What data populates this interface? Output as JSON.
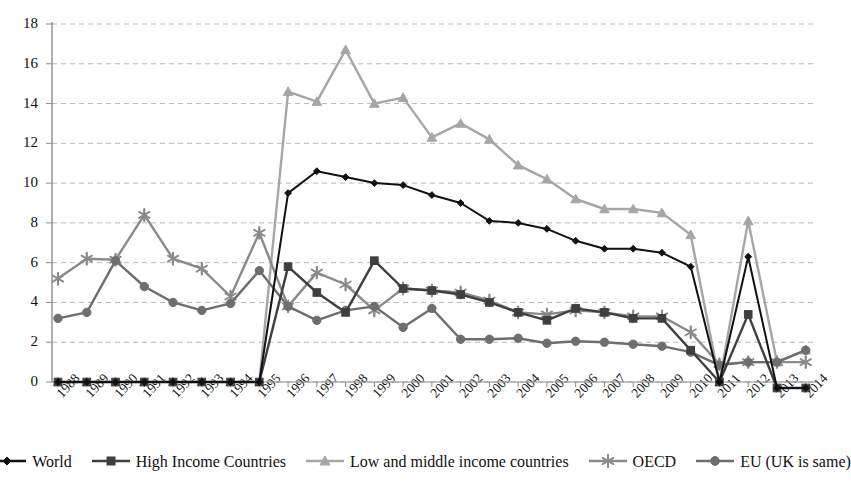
{
  "chart_data": {
    "type": "line",
    "title": "",
    "xlabel": "",
    "ylabel": "",
    "ylim": [
      0,
      18
    ],
    "ytick_step": 2,
    "grid": true,
    "legend_position": "bottom",
    "categories": [
      "1988",
      "1989",
      "1990",
      "1991",
      "1992",
      "1993",
      "1994",
      "1995",
      "1996",
      "1997",
      "1998",
      "1999",
      "2000",
      "2001",
      "2002",
      "2003",
      "2004",
      "2005",
      "2006",
      "2007",
      "2008",
      "2009",
      "2010",
      "2011",
      "2012",
      "2013",
      "2014"
    ],
    "yticks": [
      "0",
      "2",
      "4",
      "6",
      "8",
      "10",
      "12",
      "14",
      "16",
      "18"
    ],
    "series": [
      {
        "name": "World",
        "marker": "diamond",
        "color": "#111111",
        "values": [
          0,
          0,
          0,
          0,
          0,
          0,
          0,
          0,
          9.5,
          10.6,
          10.3,
          10.0,
          9.9,
          9.4,
          9.0,
          8.1,
          8.0,
          7.7,
          7.1,
          6.7,
          6.7,
          6.5,
          5.8,
          0.0,
          6.3,
          -0.3,
          -0.3
        ]
      },
      {
        "name": "High Income Countries",
        "marker": "square",
        "color": "#3f3f3f",
        "values": [
          0,
          0,
          0,
          0,
          0,
          0,
          0,
          0,
          5.8,
          4.5,
          3.5,
          6.1,
          4.7,
          4.6,
          4.4,
          4.0,
          3.5,
          3.1,
          3.7,
          3.5,
          3.2,
          3.2,
          1.6,
          0.0,
          3.4,
          -0.3,
          -0.3
        ]
      },
      {
        "name": "Low and middle income countries",
        "marker": "triangle",
        "color": "#a6a6a6",
        "values": [
          0,
          0,
          0,
          0,
          0,
          0,
          0,
          0,
          14.6,
          14.1,
          16.7,
          14.0,
          14.3,
          12.3,
          13.0,
          12.2,
          10.9,
          10.2,
          9.2,
          8.7,
          8.7,
          8.5,
          7.4,
          0.0,
          8.1,
          1.0,
          1.6
        ]
      },
      {
        "name": "OECD",
        "marker": "star",
        "color": "#8a8a8a",
        "values": [
          5.2,
          6.2,
          6.15,
          8.4,
          6.2,
          5.7,
          4.3,
          7.5,
          3.8,
          5.5,
          4.9,
          3.6,
          4.7,
          4.6,
          4.5,
          4.1,
          3.5,
          3.4,
          3.6,
          3.5,
          3.3,
          3.3,
          2.5,
          0.9,
          1.0,
          1.0,
          1.0
        ]
      },
      {
        "name": "EU (UK is same)",
        "marker": "circle",
        "color": "#6e6e6e",
        "values": [
          3.2,
          3.5,
          6.1,
          4.8,
          4.0,
          3.6,
          3.95,
          5.6,
          3.8,
          3.1,
          3.6,
          3.8,
          2.75,
          3.7,
          2.15,
          2.15,
          2.2,
          1.95,
          2.05,
          2.0,
          1.9,
          1.8,
          1.5,
          0.85,
          1.0,
          1.0,
          1.6
        ]
      }
    ]
  },
  "legend": {
    "items": [
      {
        "label": "World"
      },
      {
        "label": "High Income Countries"
      },
      {
        "label": "Low and middle income countries"
      },
      {
        "label": "OECD"
      },
      {
        "label": "EU (UK is same)"
      }
    ]
  }
}
